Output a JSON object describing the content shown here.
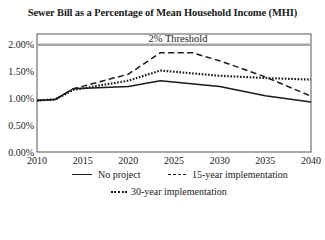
{
  "chart_data": {
    "type": "line",
    "title": "Sewer Bill as a Percentage of  Mean Household Income (MHI)",
    "xlabel": "",
    "ylabel": "",
    "xlim": [
      2010,
      2040
    ],
    "ylim": [
      0,
      0.022
    ],
    "x_ticks": [
      "2010",
      "2015",
      "2020",
      "2025",
      "2030",
      "2035",
      "2040"
    ],
    "y_ticks": [
      "0.00%",
      "0.50%",
      "1.00%",
      "1.50%",
      "2.00%"
    ],
    "grid": false,
    "legend_position": "bottom",
    "threshold": {
      "label": "2% Threshold",
      "value": 0.02,
      "color": "#a6a6a6"
    },
    "series": [
      {
        "name": "No project",
        "style": "solid",
        "x": [
          2010,
          2012,
          2014,
          2020,
          2023.5,
          2030,
          2035,
          2040
        ],
        "values": [
          0.0096,
          0.0098,
          0.0118,
          0.0122,
          0.0133,
          0.0122,
          0.0105,
          0.0093
        ]
      },
      {
        "name": "15-year implementation",
        "style": "dashed",
        "x": [
          2010,
          2012,
          2014,
          2020,
          2023.5,
          2027,
          2030,
          2035,
          2040
        ],
        "values": [
          0.0096,
          0.0098,
          0.0118,
          0.0145,
          0.0185,
          0.0185,
          0.017,
          0.014,
          0.0104
        ]
      },
      {
        "name": "30-year implementation",
        "style": "dotted",
        "x": [
          2010,
          2012,
          2014,
          2020,
          2023.5,
          2030,
          2035,
          2040
        ],
        "values": [
          0.0096,
          0.0098,
          0.0116,
          0.0133,
          0.0152,
          0.0142,
          0.0138,
          0.0135
        ]
      }
    ]
  },
  "legend": {
    "items": [
      {
        "label": "No project"
      },
      {
        "label": "15-year implementation"
      },
      {
        "label": "30-year implementation"
      }
    ]
  }
}
